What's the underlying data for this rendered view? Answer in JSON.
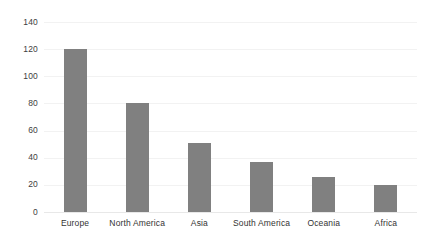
{
  "chart_data": {
    "type": "bar",
    "title": "",
    "subtitle": "",
    "xlabel": "",
    "ylabel": "",
    "categories": [
      "Europe",
      "North America",
      "Asia",
      "South America",
      "Oceania",
      "Africa"
    ],
    "values": [
      120,
      80,
      51,
      37,
      26,
      20
    ],
    "ylim": [
      0,
      140
    ],
    "yticks": [
      0,
      20,
      40,
      60,
      80,
      100,
      120,
      140
    ],
    "ytick_labels": [
      "0",
      "20",
      "40",
      "60",
      "80",
      "100",
      "120",
      "140"
    ],
    "grid": true,
    "grid_axis": "y",
    "legend": false,
    "legend_position": "none",
    "series": [
      {
        "name": "",
        "values": [
          120,
          80,
          51,
          37,
          26,
          20
        ]
      }
    ],
    "colors": {
      "bar": "#808080",
      "gridline": "#f2f2f2",
      "axis": "#e8e8e8",
      "tick_text": "#333333",
      "background": "#ffffff"
    }
  }
}
